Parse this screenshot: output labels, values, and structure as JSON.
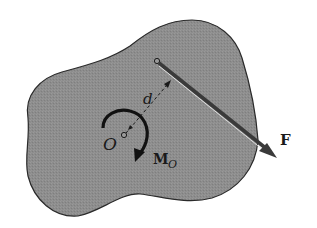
{
  "figure": {
    "colors": {
      "body_fill": "#8d8d8d",
      "body_outline": "#2a2a2a",
      "force_arrow": "#3a3a3a",
      "force_highlight": "#e8e8e8",
      "moment_arrow": "#111111",
      "background": "#ffffff"
    }
  },
  "labels": {
    "force": "F",
    "point": "O",
    "distance": "d",
    "moment_main": "M",
    "moment_sub": "O"
  },
  "elements": {
    "rigid_body": "irregular gray body",
    "force_vector": "F",
    "moment_arc": "M_O clockwise",
    "moment_arm": "d"
  }
}
